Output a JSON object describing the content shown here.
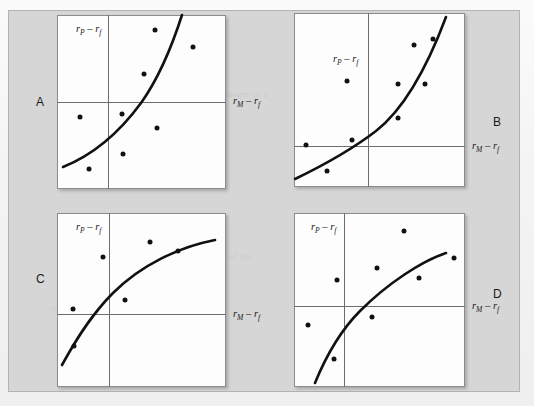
{
  "figure": {
    "background_color": "#d6d6d6",
    "plot_background_color": "#fdfdfd",
    "curve_color": "#111111",
    "point_color": "#111111",
    "axis_color": "#6d6d6d"
  },
  "axis_labels": {
    "y": {
      "r": "r",
      "sub_p": "P",
      "minus": " – ",
      "r2": "r",
      "sub_f": "f",
      "full": "rP – rf"
    },
    "x": {
      "r": "r",
      "sub_m": "M",
      "minus": " – ",
      "r2": "r",
      "sub_f": "f",
      "full": "rM – rf"
    }
  },
  "panels": [
    {
      "id": "A",
      "label": "A",
      "label_side": "left",
      "y_axis_label": "rP – rf",
      "x_axis_label": "rM – rf",
      "origin": {
        "x_frac": 0.304,
        "y_frac": 0.499
      },
      "curve_shape": "convex-increasing-steep",
      "points": [
        {
          "x": 0.582,
          "y": 0.086
        },
        {
          "x": 0.804,
          "y": 0.185
        },
        {
          "x": 0.514,
          "y": 0.339
        },
        {
          "x": 0.133,
          "y": 0.585
        },
        {
          "x": 0.384,
          "y": 0.568
        },
        {
          "x": 0.592,
          "y": 0.648
        },
        {
          "x": 0.392,
          "y": 0.8
        },
        {
          "x": 0.188,
          "y": 0.884
        }
      ]
    },
    {
      "id": "B",
      "label": "B",
      "label_side": "right",
      "y_axis_label": "rP – rf",
      "x_axis_label": "rM – rf",
      "origin": {
        "x_frac": 0.43,
        "y_frac": 0.762
      },
      "curve_shape": "convex-increasing",
      "points": [
        {
          "x": 0.7,
          "y": 0.185
        },
        {
          "x": 0.81,
          "y": 0.149
        },
        {
          "x": 0.31,
          "y": 0.39
        },
        {
          "x": 0.607,
          "y": 0.408
        },
        {
          "x": 0.764,
          "y": 0.41
        },
        {
          "x": 0.61,
          "y": 0.602
        },
        {
          "x": 0.339,
          "y": 0.729
        },
        {
          "x": 0.068,
          "y": 0.758
        },
        {
          "x": 0.194,
          "y": 0.91
        }
      ]
    },
    {
      "id": "C",
      "label": "C",
      "label_side": "left",
      "y_axis_label": "rP – rf",
      "x_axis_label": "rM – rf",
      "origin": {
        "x_frac": 0.306,
        "y_frac": 0.581
      },
      "curve_shape": "concave-increasing",
      "points": [
        {
          "x": 0.549,
          "y": 0.168
        },
        {
          "x": 0.716,
          "y": 0.219
        },
        {
          "x": 0.271,
          "y": 0.253
        },
        {
          "x": 0.402,
          "y": 0.499
        },
        {
          "x": 0.094,
          "y": 0.549
        },
        {
          "x": 0.102,
          "y": 0.762
        }
      ]
    },
    {
      "id": "D",
      "label": "D",
      "label_side": "right",
      "y_axis_label": "rP – rf",
      "x_axis_label": "rM – rf",
      "origin": {
        "x_frac": 0.295,
        "y_frac": 0.535
      },
      "curve_shape": "concave-increasing",
      "points": [
        {
          "x": 0.643,
          "y": 0.101
        },
        {
          "x": 0.934,
          "y": 0.261
        },
        {
          "x": 0.485,
          "y": 0.314
        },
        {
          "x": 0.254,
          "y": 0.387
        },
        {
          "x": 0.733,
          "y": 0.371
        },
        {
          "x": 0.457,
          "y": 0.6
        },
        {
          "x": 0.081,
          "y": 0.644
        },
        {
          "x": 0.233,
          "y": 0.838
        }
      ]
    }
  ],
  "background_ghost_lines": [
    "the market was the",
    "a manager of a",
    "the relationship between the",
    "the measurement of the",
    "the rate that the low, power of the",
    "indicate the manager",
    "different from that"
  ]
}
